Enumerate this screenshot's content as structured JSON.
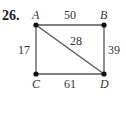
{
  "problem_number": "26.",
  "vertices": {
    "A": {
      "label": "A"
    },
    "B": {
      "label": "B"
    },
    "C": {
      "label": "C"
    },
    "D": {
      "label": "D"
    }
  },
  "edges": {
    "AB": {
      "weight": "50"
    },
    "AC": {
      "weight": "17"
    },
    "AD": {
      "weight": "28"
    },
    "BD": {
      "weight": "39"
    },
    "CD": {
      "weight": "61"
    }
  }
}
